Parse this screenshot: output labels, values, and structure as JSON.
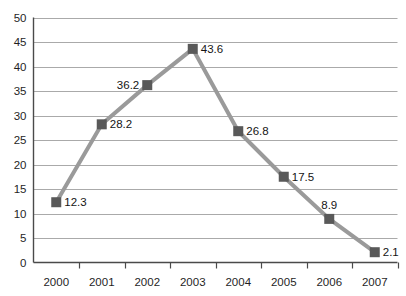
{
  "chart_data": {
    "type": "line",
    "title": "",
    "subtitle": "",
    "xlabel": "",
    "ylabel": "",
    "categories": [
      "2000",
      "2001",
      "2002",
      "2003",
      "2004",
      "2005",
      "2006",
      "2007"
    ],
    "values": [
      12.3,
      28.2,
      36.2,
      43.6,
      26.8,
      17.5,
      8.9,
      2.1
    ],
    "data_labels": [
      "12.3",
      "28.2",
      "36.2",
      "43.6",
      "26.8",
      "17.5",
      "8.9",
      "2.1"
    ],
    "data_label_positions": [
      "right",
      "right",
      "left",
      "right",
      "right",
      "right",
      "above",
      "right"
    ],
    "ylim": [
      0,
      50
    ],
    "ytick_step": 5,
    "ytick_labels": [
      "0",
      "5",
      "10",
      "15",
      "20",
      "25",
      "30",
      "35",
      "40",
      "45",
      "50"
    ],
    "xtick_labels": [
      "2000",
      "2001",
      "2002",
      "2003",
      "2004",
      "2005",
      "2006",
      "2007"
    ],
    "grid": true,
    "grid_axis": "y",
    "legend": false,
    "legend_position": "none",
    "series": [
      {
        "name": "series-1",
        "values": [
          12.3,
          28.2,
          36.2,
          43.6,
          26.8,
          17.5,
          8.9,
          2.1
        ]
      }
    ],
    "colors": {
      "line": "#9a9a9a",
      "marker": "#595959",
      "gridline": "#aaaaaa",
      "axis": "#4a4a4a",
      "background": "#ffffff",
      "text": "#141414"
    },
    "marker_shape": "square",
    "line_width": 4,
    "marker_size": 10
  }
}
